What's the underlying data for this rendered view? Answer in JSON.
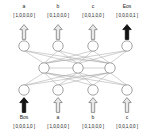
{
  "figure": {
    "kind": "encoder-decoder-rnn-diagram",
    "vocabulary_size": 5,
    "colors": {
      "node_stroke": "#8c8c8c",
      "node_fill": "#ffffff",
      "edge": "#a8a8a8",
      "arrow_outline_stroke": "#8a8a8a",
      "arrow_outline_fill": "#e8e8e8",
      "arrow_filled": "#151515",
      "text": "#1b1b1b"
    }
  },
  "output_row": {
    "items": [
      {
        "token": "a",
        "vector": "[ 1,0,0,0,0 ]",
        "arrow": "outline",
        "arrow_direction": "up"
      },
      {
        "token": "b",
        "vector": "[ 0,1,0,0,0 ]",
        "arrow": "outline",
        "arrow_direction": "up"
      },
      {
        "token": "c",
        "vector": "[ 0,0,1,0,0 ]",
        "arrow": "outline",
        "arrow_direction": "up"
      },
      {
        "token": "Eos",
        "vector": "[ 0,0,0,0,1 ]",
        "arrow": "filled",
        "arrow_direction": "up"
      }
    ]
  },
  "input_row": {
    "items": [
      {
        "token": "Bos",
        "vector": "[ 0,0,0,1,0 ]",
        "arrow": "filled",
        "arrow_direction": "up"
      },
      {
        "token": "a",
        "vector": "[ 1,0,0,0,0 ]",
        "arrow": "outline",
        "arrow_direction": "up"
      },
      {
        "token": "b",
        "vector": "[ 0,1,0,0,0 ]",
        "arrow": "outline",
        "arrow_direction": "up"
      },
      {
        "token": "c",
        "vector": "[ 0,0,1,0,0 ]",
        "arrow": "outline",
        "arrow_direction": "up"
      }
    ]
  },
  "network": {
    "layers": [
      {
        "name": "output-layer",
        "node_count": 4
      },
      {
        "name": "hidden-layer",
        "node_count": 3
      },
      {
        "name": "input-layer",
        "node_count": 4
      }
    ]
  }
}
